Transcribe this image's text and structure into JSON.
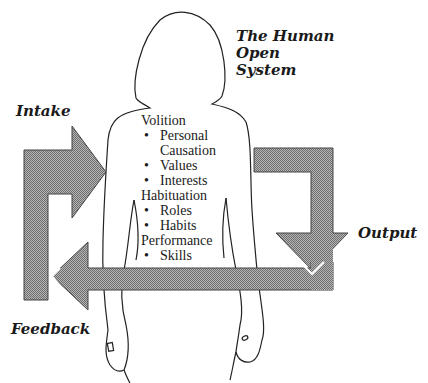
{
  "title": {
    "lines": [
      "The Human",
      "Open",
      "System"
    ]
  },
  "labels": {
    "intake": "Intake",
    "output": "Output",
    "feedback": "Feedback"
  },
  "subsystems": [
    {
      "heading": "Volition",
      "items": [
        {
          "bullet": "•",
          "text": "Personal",
          "continuation": "Causation"
        },
        {
          "bullet": "•",
          "text": "Values"
        },
        {
          "bullet": "•",
          "text": "Interests"
        }
      ]
    },
    {
      "heading": "Habituation",
      "items": [
        {
          "bullet": "•",
          "text": "Roles"
        },
        {
          "bullet": "•",
          "text": "Habits"
        }
      ]
    },
    {
      "heading": "Performance",
      "items": [
        {
          "bullet": "•",
          "text": "Skills"
        }
      ]
    }
  ],
  "colors": {
    "arrow_fill": "#9a9a9a",
    "arrow_stroke": "#444444",
    "outline": "#222222",
    "text": "#1a1a1a"
  }
}
